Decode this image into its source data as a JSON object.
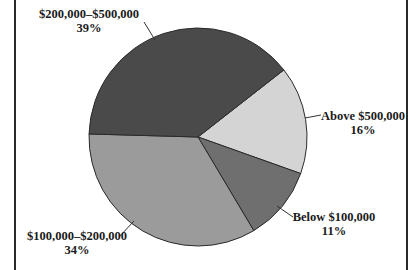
{
  "chart_data": {
    "type": "pie",
    "title": "",
    "start_angle_deg_clockwise_from_top": 52,
    "slices": [
      {
        "label": "Above $500,000",
        "value": 16,
        "value_label": "16%",
        "color": "#d4d4d4"
      },
      {
        "label": "Below $100,000",
        "value": 11,
        "value_label": "11%",
        "color": "#6f6f6f"
      },
      {
        "label": "$100,000–$200,000",
        "value": 34,
        "value_label": "34%",
        "color": "#9b9b9b"
      },
      {
        "label": "$200,000–$500,000",
        "value": 39,
        "value_label": "39%",
        "color": "#4a4a4a"
      }
    ],
    "legend": "none (direct labels with leader lines)"
  },
  "labels": {
    "above_500k": {
      "name": "Above $500,000",
      "pct": "16%"
    },
    "below_100k": {
      "name": "Below $100,000",
      "pct": "11%"
    },
    "r100k_200k": {
      "name": "$100,000–$200,000",
      "pct": "34%"
    },
    "r200k_500k": {
      "name": "$200,000–$500,000",
      "pct": "39%"
    }
  }
}
